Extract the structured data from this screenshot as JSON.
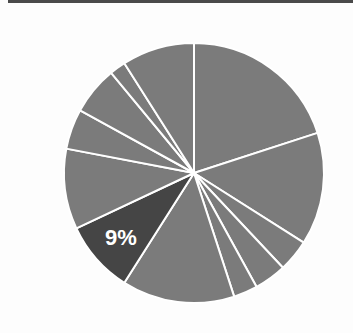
{
  "chart_data": {
    "type": "pie",
    "title": "",
    "start_angle_deg": 0,
    "direction": "clockwise",
    "center": [
      194,
      173
    ],
    "radius": 130,
    "slices": [
      {
        "value": 20,
        "color": "#7b7b7b",
        "label": ""
      },
      {
        "value": 14,
        "color": "#7b7b7b",
        "label": ""
      },
      {
        "value": 4,
        "color": "#7b7b7b",
        "label": ""
      },
      {
        "value": 4,
        "color": "#7b7b7b",
        "label": ""
      },
      {
        "value": 3,
        "color": "#7b7b7b",
        "label": ""
      },
      {
        "value": 14,
        "color": "#7b7b7b",
        "label": ""
      },
      {
        "value": 9,
        "color": "#454545",
        "label": "9%",
        "highlighted": true
      },
      {
        "value": 10,
        "color": "#7b7b7b",
        "label": ""
      },
      {
        "value": 5,
        "color": "#7b7b7b",
        "label": ""
      },
      {
        "value": 6,
        "color": "#7b7b7b",
        "label": ""
      },
      {
        "value": 2,
        "color": "#7b7b7b",
        "label": ""
      },
      {
        "value": 9,
        "color": "#7b7b7b",
        "label": ""
      }
    ],
    "annotations": [
      "9%"
    ],
    "legend": null
  },
  "colors": {
    "slice_default": "#7b7b7b",
    "slice_highlight": "#454545",
    "separator": "#ffffff",
    "top_rule": "#4a4a4a",
    "background": "#fdfdfd"
  },
  "highlight_label": "9%"
}
